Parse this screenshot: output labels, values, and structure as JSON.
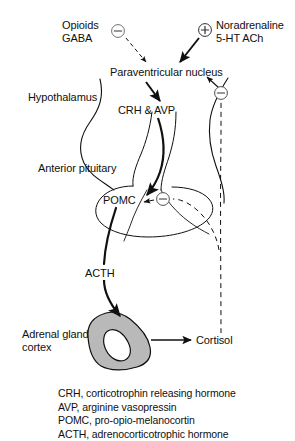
{
  "figure": {
    "background_color": "#ffffff",
    "line_color": "#101010",
    "gland_fill_color": "#b9b9b9"
  },
  "labels": {
    "opioids": "Opioids",
    "gaba": "GABA",
    "noradrenaline": "Noradrenaline",
    "serotonin_ach": "5-HT ACh",
    "paraventricular_nucleus": "Paraventricular nucleus",
    "hypothalamus": "Hypothalamus",
    "crh_avp": "CRH & AVP",
    "anterior_pituitary": "Anterior pituitary",
    "pomc": "POMC",
    "acth": "ACTH",
    "adrenal_gland": "Adrenal gland",
    "cortex": "cortex",
    "cortisol": "Cortisol"
  },
  "signs": {
    "inhibitory": "–",
    "excitatory": "+"
  },
  "sign_nodes": [
    {
      "name": "opioids-gaba-inhibition",
      "sign": "–",
      "x": 118,
      "y": 31
    },
    {
      "name": "noradrenaline-excitation",
      "sign": "+",
      "x": 205,
      "y": 30
    },
    {
      "name": "cortisol-pvn-inhibition",
      "sign": "–",
      "x": 221,
      "y": 93
    },
    {
      "name": "cortisol-pomc-inhibition",
      "sign": "–",
      "x": 163,
      "y": 199
    }
  ],
  "legend": {
    "items": [
      "CRH, corticotrophin releasing hormone",
      "AVP, arginine vasopressin",
      "POMC, pro-opio-melanocortin",
      "ACTH, adrenocorticotrophic hormone"
    ]
  }
}
